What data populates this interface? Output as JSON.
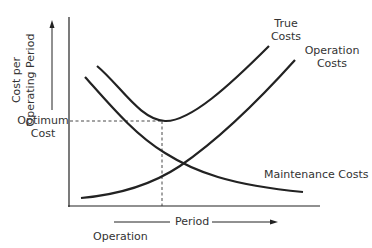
{
  "diagram": {
    "y_axis_label_line1": "Cost per",
    "y_axis_label_line2": "Operating Period",
    "optimum_label_line1": "Optimum",
    "optimum_label_line2": "Cost",
    "x_axis_label": "Period",
    "x_axis_sublabel": "Operation",
    "curves": {
      "true_costs_line1": "True",
      "true_costs_line2": "Costs",
      "operation_costs_line1": "Operation",
      "operation_costs_line2": "Costs",
      "maintenance_costs": "Maintenance Costs"
    },
    "colors": {
      "line": "#222222",
      "text": "#333333",
      "background": "#ffffff"
    }
  }
}
